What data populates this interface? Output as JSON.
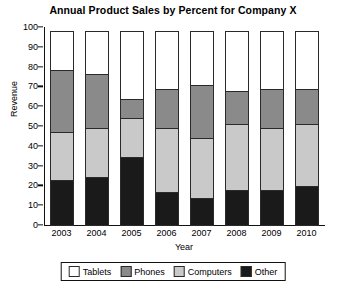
{
  "chart_data": {
    "type": "bar",
    "stacked": true,
    "title": "Annual Product Sales by Percent for Company X",
    "xlabel": "Year",
    "ylabel": "Revenue",
    "categories": [
      "2003",
      "2004",
      "2005",
      "2006",
      "2007",
      "2008",
      "2009",
      "2010"
    ],
    "ylim": [
      0,
      100
    ],
    "yticks": [
      0,
      10,
      20,
      30,
      40,
      50,
      60,
      70,
      80,
      90,
      100
    ],
    "grid": false,
    "legend_position": "bottom",
    "series": [
      {
        "name": "Other",
        "color": "#1a1a1a",
        "values": [
          23,
          25,
          35,
          17,
          14,
          18,
          18,
          20
        ]
      },
      {
        "name": "Computers",
        "color": "#c9c9c9",
        "values": [
          25,
          25,
          20,
          33,
          31,
          34,
          32,
          32
        ]
      },
      {
        "name": "Phones",
        "color": "#8a8a8a",
        "values": [
          32,
          28,
          10,
          20,
          27,
          17,
          20,
          18
        ]
      },
      {
        "name": "Tablets",
        "color": "#ffffff",
        "values": [
          20,
          22,
          35,
          30,
          28,
          31,
          30,
          30
        ]
      }
    ],
    "cumulative_tops": {
      "other": [
        23,
        25,
        35,
        17,
        14,
        18,
        18,
        20
      ],
      "computers": [
        48,
        50,
        55,
        50,
        45,
        52,
        50,
        52
      ],
      "phones": [
        80,
        78,
        65,
        70,
        72,
        69,
        70,
        70
      ],
      "tablets": [
        100,
        100,
        100,
        100,
        100,
        100,
        100,
        100
      ]
    }
  },
  "legend": {
    "items": [
      {
        "label": "Tablets",
        "key": "tablets"
      },
      {
        "label": "Phones",
        "key": "phones"
      },
      {
        "label": "Computers",
        "key": "computers"
      },
      {
        "label": "Other",
        "key": "other"
      }
    ]
  }
}
